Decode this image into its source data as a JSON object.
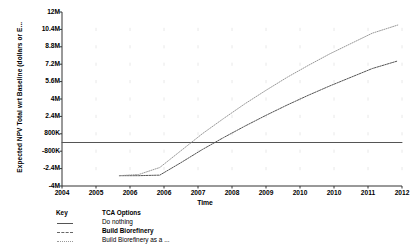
{
  "chart_data": {
    "type": "line",
    "title": "",
    "xlabel": "Time",
    "ylabel": "Expected NPV Total wrt Baseline (dollars or E...",
    "xlim": [
      2004,
      2012
    ],
    "ylim": [
      -4000000,
      12000000
    ],
    "grid": true,
    "legend_position": "below-left",
    "x_tick_labels": [
      "2004",
      "2005",
      "2006",
      "2006",
      "2007",
      "2008",
      "2009",
      "2010",
      "2010",
      "2011",
      "2012"
    ],
    "x_tick_values": [
      2004,
      2004.8,
      2005.6,
      2006.4,
      2007.2,
      2008,
      2008.8,
      2009.6,
      2010.4,
      2011.2,
      2012
    ],
    "y_tick_labels": [
      "12M",
      "10.4M",
      "8.8M",
      "7.2M",
      "5.6M",
      "4M",
      "2.4M",
      "800K",
      "-800K",
      "-2.4M",
      "-4M"
    ],
    "y_tick_values": [
      12000000,
      10400000,
      8800000,
      7200000,
      5600000,
      4000000,
      2400000,
      800000,
      -800000,
      -2400000,
      -4000000
    ],
    "series": [
      {
        "name": "Do nothing",
        "style": "solid",
        "color": "#555555",
        "x": [
          2004.0,
          2012.0
        ],
        "values": [
          0,
          0
        ]
      },
      {
        "name": "Build Biorefinery",
        "style": "dashed",
        "color": "#555555",
        "x": [
          2005.35,
          2005.8,
          2006.3,
          2006.8,
          2007.3,
          2007.8,
          2008.3,
          2008.8,
          2009.3,
          2009.8,
          2010.3,
          2010.8,
          2011.3,
          2011.9
        ],
        "values": [
          -3050000,
          -3050000,
          -3000000,
          -1850000,
          -650000,
          450000,
          1500000,
          2500000,
          3450000,
          4350000,
          5200000,
          6000000,
          6800000,
          7500000
        ]
      },
      {
        "name": "Build Biorefinery as a ...",
        "style": "dotted",
        "color": "#999999",
        "x": [
          2005.35,
          2005.8,
          2006.3,
          2006.8,
          2007.3,
          2007.8,
          2008.3,
          2008.8,
          2009.3,
          2009.8,
          2010.3,
          2010.8,
          2011.3,
          2011.9
        ],
        "values": [
          -3050000,
          -2950000,
          -2300000,
          -750000,
          800000,
          2200000,
          3550000,
          4800000,
          6000000,
          7100000,
          8150000,
          9100000,
          10050000,
          10800000
        ]
      }
    ]
  },
  "legend": {
    "header_key": "Key",
    "header_options": "TCA Options",
    "rows": [
      {
        "label": "Do nothing",
        "style": "solid",
        "bold": false
      },
      {
        "label": "Build Biorefinery",
        "style": "dashed",
        "bold": true
      },
      {
        "label": "Build Biorefinery as a ...",
        "style": "dotted",
        "bold": false
      }
    ]
  },
  "colors": {
    "axis": "#333333",
    "grid": "#e8e8e8",
    "background": "#ffffff"
  }
}
